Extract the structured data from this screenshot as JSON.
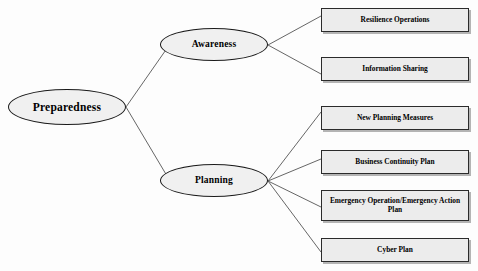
{
  "diagram": {
    "type": "tree",
    "background_color": "#fdfdfd",
    "node_fill_ellipse": "#f0f0f0",
    "node_fill_box": "#ececec",
    "node_stroke": "#1a1a1a",
    "edge_color": "#555555",
    "root": {
      "id": "preparedness",
      "label": "Preparedness",
      "shape": "ellipse"
    },
    "branches": [
      {
        "id": "awareness",
        "label": "Awareness",
        "shape": "ellipse",
        "children": [
          {
            "id": "resilience-operations",
            "label": "Resilience Operations",
            "shape": "rectangle"
          },
          {
            "id": "information-sharing",
            "label": "Information Sharing",
            "shape": "rectangle"
          }
        ]
      },
      {
        "id": "planning",
        "label": "Planning",
        "shape": "ellipse",
        "children": [
          {
            "id": "new-planning-measures",
            "label": "New Planning Measures",
            "shape": "rectangle"
          },
          {
            "id": "business-continuity-plan",
            "label": "Business Continuity Plan",
            "shape": "rectangle"
          },
          {
            "id": "emergency-operation-action-plan",
            "label": "Emergency Operation/Emergency Action Plan",
            "shape": "rectangle"
          },
          {
            "id": "cyber-plan",
            "label": "Cyber Plan",
            "shape": "rectangle"
          }
        ]
      }
    ],
    "edges": [
      {
        "from": "preparedness",
        "to": "awareness"
      },
      {
        "from": "preparedness",
        "to": "planning"
      },
      {
        "from": "awareness",
        "to": "resilience-operations"
      },
      {
        "from": "awareness",
        "to": "information-sharing"
      },
      {
        "from": "planning",
        "to": "new-planning-measures"
      },
      {
        "from": "planning",
        "to": "business-continuity-plan"
      },
      {
        "from": "planning",
        "to": "emergency-operation-action-plan"
      },
      {
        "from": "planning",
        "to": "cyber-plan"
      }
    ]
  }
}
